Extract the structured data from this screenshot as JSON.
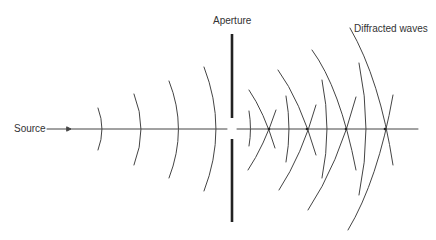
{
  "diagram": {
    "labels": {
      "source": "Source",
      "aperture": "Aperture",
      "diffracted": "Diffracted waves"
    },
    "colors": {
      "line": "#444444",
      "text": "#333333",
      "background": "#ffffff"
    },
    "incident_wavefronts": 4,
    "diffracted_crossings": 4
  }
}
